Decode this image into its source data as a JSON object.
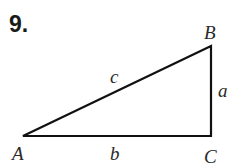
{
  "problem": {
    "number": "9."
  },
  "triangle": {
    "vertices": {
      "A": {
        "label": "A",
        "x": 23,
        "y": 136
      },
      "B": {
        "label": "B",
        "x": 211,
        "y": 46
      },
      "C": {
        "label": "C",
        "x": 211,
        "y": 136
      }
    },
    "sides": {
      "a": {
        "label": "a",
        "between": [
          "B",
          "C"
        ]
      },
      "b": {
        "label": "b",
        "between": [
          "A",
          "C"
        ]
      },
      "c": {
        "label": "c",
        "between": [
          "A",
          "B"
        ]
      }
    },
    "right_angle_at": "C",
    "stroke_color": "#111111"
  }
}
